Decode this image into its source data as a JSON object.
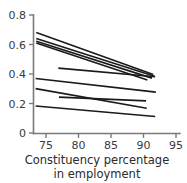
{
  "chart_data": {
    "type": "line",
    "title": "",
    "subtitle": "",
    "xlabel": "Constituency percentage in employment",
    "xlabel_line1": "Constituency percentage",
    "xlabel_line2": "in employment",
    "ylabel": "",
    "xlim": [
      73.0,
      96.5
    ],
    "ylim": [
      0,
      0.82
    ],
    "xticks": [
      75,
      80,
      85,
      90,
      95
    ],
    "xtick_labels": [
      "75",
      "80",
      "85",
      "90",
      "95"
    ],
    "yticks": [
      0,
      0.2,
      0.4,
      0.6,
      0.8
    ],
    "ytick_labels": [
      "0",
      "0.2",
      "0.4",
      "0.6",
      "0.8"
    ],
    "grid": false,
    "legend": "none",
    "line_color": "#1a1a1a",
    "axis_color": "#7a7a7a",
    "background_color": "#ffffff",
    "series": [
      {
        "name": "line-1",
        "x": [
          73.5,
          91.5
        ],
        "values": [
          0.681,
          0.397
        ]
      },
      {
        "name": "line-2",
        "x": [
          73.5,
          91.7
        ],
        "values": [
          0.641,
          0.385
        ]
      },
      {
        "name": "line-3",
        "x": [
          73.5,
          91.3
        ],
        "values": [
          0.622,
          0.372
        ]
      },
      {
        "name": "line-4",
        "x": [
          73.5,
          90.6
        ],
        "values": [
          0.61,
          0.36
        ]
      },
      {
        "name": "line-5",
        "x": [
          76.9,
          91.8
        ],
        "values": [
          0.44,
          0.381
        ]
      },
      {
        "name": "line-6",
        "x": [
          73.4,
          91.9
        ],
        "values": [
          0.37,
          0.277
        ]
      },
      {
        "name": "line-7",
        "x": [
          73.4,
          90.5
        ],
        "values": [
          0.301,
          0.168
        ]
      },
      {
        "name": "line-8",
        "x": [
          77.0,
          90.4
        ],
        "values": [
          0.243,
          0.218
        ]
      },
      {
        "name": "line-9",
        "x": [
          73.4,
          91.8
        ],
        "values": [
          0.183,
          0.112
        ]
      }
    ]
  }
}
